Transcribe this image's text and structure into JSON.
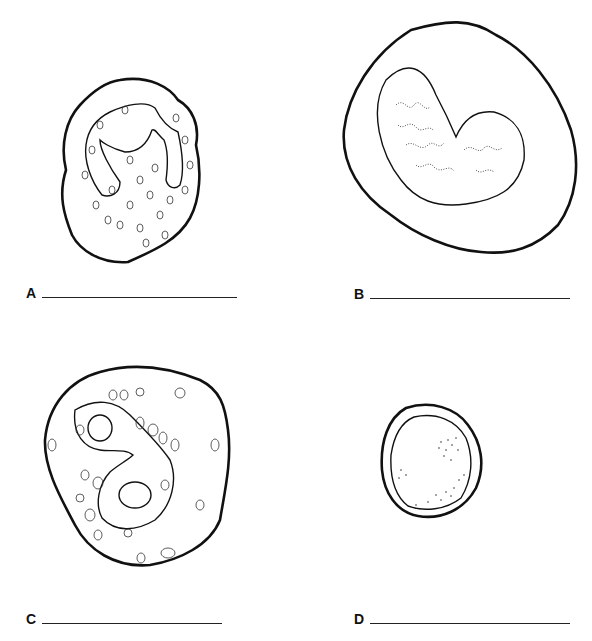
{
  "figure": {
    "type": "blood cell identification worksheet",
    "panels": [
      {
        "label": "A",
        "description": "cell with lobed (band-shaped) nucleus and many small granules"
      },
      {
        "label": "B",
        "description": "large cell with kidney-shaped nucleus and fine chromatin"
      },
      {
        "label": "C",
        "description": "cell with bilobed nucleus and large granules"
      },
      {
        "label": "D",
        "description": "small round cell with large round nucleus and thin cytoplasm rim"
      }
    ]
  }
}
